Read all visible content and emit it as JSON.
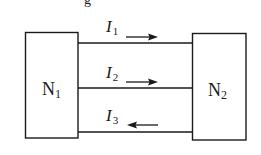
{
  "diagram": {
    "type": "two-port network connection",
    "top_clipped_glyph": "g",
    "nodes": [
      {
        "id": "N1",
        "label": "N",
        "subscript": "1",
        "x": 25,
        "y": 32,
        "width": 53,
        "height": 106
      },
      {
        "id": "N2",
        "label": "N",
        "subscript": "2",
        "x": 192,
        "y": 33,
        "width": 54,
        "height": 107
      }
    ],
    "wires": [
      {
        "id": "wire-1",
        "y": 43,
        "current": {
          "label": "I",
          "subscript": "1",
          "direction": "right"
        }
      },
      {
        "id": "wire-2",
        "y": 88,
        "current": {
          "label": "I",
          "subscript": "2",
          "direction": "right"
        }
      },
      {
        "id": "wire-3",
        "y": 132,
        "current": {
          "label": "I",
          "subscript": "3",
          "direction": "left"
        }
      }
    ],
    "colors": {
      "stroke": "#1a1a1a",
      "background": "#ffffff"
    }
  }
}
